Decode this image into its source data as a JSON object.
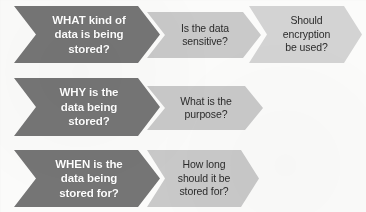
{
  "diagram": {
    "type": "chevron-process-flow",
    "title": "",
    "background_color": "#fbfbfa",
    "primary_color": "#757575",
    "secondary_color": "#c9c9c9",
    "primary_text_color": "#ffffff",
    "secondary_text_color": "#2b2b2b",
    "rows": [
      {
        "id": "row-what",
        "steps": [
          {
            "id": "what-kind-of-data",
            "tone": "dark",
            "text": "WHAT kind of\ndata is being\nstored?"
          },
          {
            "id": "is-data-sensitive",
            "tone": "light",
            "text": "Is the data\nsensitive?"
          },
          {
            "id": "should-encryption-be-used",
            "tone": "light",
            "text": "Should\nencryption\nbe used?"
          }
        ]
      },
      {
        "id": "row-why",
        "steps": [
          {
            "id": "why-is-data-being-stored",
            "tone": "dark",
            "text": "WHY is the\ndata being\nstored?"
          },
          {
            "id": "what-is-the-purpose",
            "tone": "light",
            "text": "What is the\npurpose?"
          }
        ]
      },
      {
        "id": "row-when",
        "steps": [
          {
            "id": "when-is-data-being-stored-for",
            "tone": "dark",
            "text": "WHEN is the\ndata being\nstored for?"
          },
          {
            "id": "how-long-should-it-be-stored-for",
            "tone": "light",
            "text": "How long\nshould it be\nstored for?"
          }
        ]
      }
    ]
  }
}
